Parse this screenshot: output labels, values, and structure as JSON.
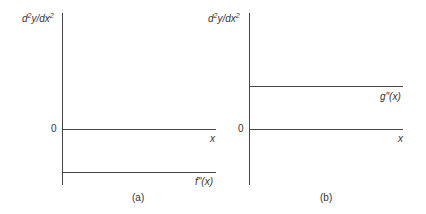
{
  "panels": [
    {
      "ylabel_base": "d",
      "ylabel": "y/dx",
      "zero": "0",
      "xlabel": "x",
      "curve_label": "f\"(x)",
      "caption": "(a)"
    },
    {
      "ylabel_base": "d",
      "ylabel": "y/dx",
      "zero": "0",
      "xlabel": "x",
      "curve_label": "g\"(x)",
      "caption": "(b)"
    }
  ]
}
